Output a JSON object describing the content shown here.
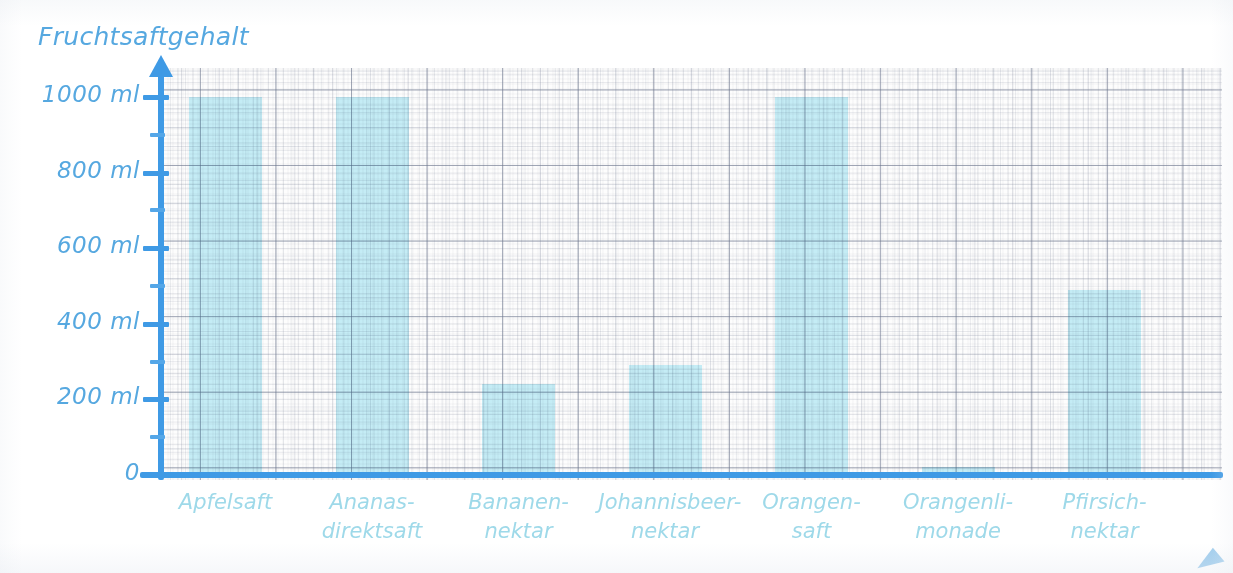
{
  "chart_data": {
    "type": "bar",
    "title": "Fruchtsaftgehalt",
    "xlabel": "",
    "ylabel": "Fruchtsaftgehalt",
    "unit": "ml",
    "ylim": [
      0,
      1050
    ],
    "grid": true,
    "legend": "none",
    "categories": [
      "Apfelsaft",
      "Ananas-\ndirektsaft",
      "Bananen-\nnektar",
      "Johannisbeer-\nnektar",
      "Orangen-\nsaft",
      "Orangenli-\nmonade",
      "Pfirsich-\nnektar"
    ],
    "values": [
      1000,
      1000,
      240,
      290,
      1000,
      20,
      490
    ],
    "y_ticks": [
      0,
      200,
      400,
      600,
      800,
      1000
    ],
    "y_tick_labels": [
      "0",
      "200 ml",
      "400 ml",
      "600 ml",
      "800 ml",
      "1000 ml"
    ],
    "y_minor_ticks": [
      100,
      300,
      500,
      700,
      900
    ],
    "bar_color": "#c6eef7",
    "axis_color": "#3f9ae5",
    "label_color": "#56a8e0",
    "category_label_color": "#9ed9e9"
  },
  "axis": {
    "y_labels": [
      {
        "text": "1000 ml",
        "value": 1000
      },
      {
        "text": "800 ml",
        "value": 800
      },
      {
        "text": "600 ml",
        "value": 600
      },
      {
        "text": "400 ml",
        "value": 400
      },
      {
        "text": "200 ml",
        "value": 200
      },
      {
        "text": "0",
        "value": 0
      }
    ]
  }
}
